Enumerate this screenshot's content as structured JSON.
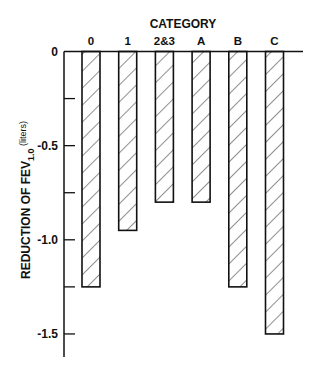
{
  "chart_data": {
    "type": "bar",
    "title": "CATEGORY",
    "xlabel": "CATEGORY",
    "ylabel": "REDUCTION OF FEV1.0 (liters)",
    "ylabel_parts": {
      "main": "REDUCTION OF FEV",
      "subscript": "1.0",
      "unit": "(liters)"
    },
    "categories": [
      "0",
      "1",
      "2&3",
      "A",
      "B",
      "C"
    ],
    "values": [
      -1.25,
      -0.95,
      -0.8,
      -0.8,
      -1.25,
      -1.5
    ],
    "ylim": [
      -1.62,
      0
    ],
    "yticks": [
      0,
      -0.25,
      -0.5,
      -0.75,
      -1.0,
      -1.25,
      -1.5
    ],
    "ytick_labels": {
      "0": "0",
      "-0.5": "-0.5",
      "-1.0": "-1.0",
      "-1.5": "-1.5"
    },
    "grid": false,
    "legend": null,
    "bar_fill": "diagonal-hatch",
    "x_axis_position": "top"
  },
  "colors": {
    "ink": "#111111",
    "background": "#ffffff"
  }
}
